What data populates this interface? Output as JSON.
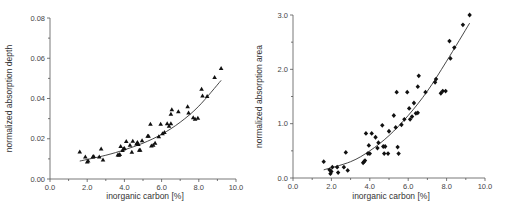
{
  "chart_data": [
    {
      "type": "scatter",
      "title": "",
      "xlabel": "inorganic carbon [%]",
      "ylabel": "normalized absorption depth",
      "xlim": [
        0,
        10
      ],
      "ylim": [
        0,
        0.08
      ],
      "xticks": [
        "0.0",
        "2.0",
        "4.0",
        "6.0",
        "8.0",
        "10.0"
      ],
      "xtick_values": [
        0,
        2,
        4,
        6,
        8,
        10
      ],
      "yticks": [
        "0.00",
        "0.02",
        "0.04",
        "0.06",
        "0.08"
      ],
      "ytick_values": [
        0,
        0.02,
        0.04,
        0.06,
        0.08
      ],
      "marker": "triangle",
      "grid": false,
      "series": [
        {
          "name": "samples",
          "points": [
            [
              1.6,
              0.0135
            ],
            [
              1.9,
              0.011
            ],
            [
              2.0,
              0.0085
            ],
            [
              2.05,
              0.009
            ],
            [
              2.3,
              0.011
            ],
            [
              2.35,
              0.0112
            ],
            [
              2.65,
              0.011
            ],
            [
              2.75,
              0.015
            ],
            [
              2.85,
              0.0095
            ],
            [
              3.65,
              0.012
            ],
            [
              3.7,
              0.0118
            ],
            [
              3.75,
              0.0122
            ],
            [
              3.8,
              0.0162
            ],
            [
              3.9,
              0.0142
            ],
            [
              3.95,
              0.015
            ],
            [
              4.0,
              0.0152
            ],
            [
              4.1,
              0.0187
            ],
            [
              4.3,
              0.0168
            ],
            [
              4.4,
              0.0133
            ],
            [
              4.45,
              0.0188
            ],
            [
              4.65,
              0.0175
            ],
            [
              4.7,
              0.0182
            ],
            [
              4.75,
              0.0172
            ],
            [
              4.8,
              0.0143
            ],
            [
              4.85,
              0.0143
            ],
            [
              4.95,
              0.019
            ],
            [
              5.25,
              0.0213
            ],
            [
              5.3,
              0.0213
            ],
            [
              5.4,
              0.0273
            ],
            [
              5.45,
              0.0165
            ],
            [
              5.55,
              0.0168
            ],
            [
              5.65,
              0.0178
            ],
            [
              5.85,
              0.021
            ],
            [
              5.95,
              0.0273
            ],
            [
              6.05,
              0.0225
            ],
            [
              6.15,
              0.0232
            ],
            [
              6.3,
              0.0275
            ],
            [
              6.4,
              0.0262
            ],
            [
              6.5,
              0.0275
            ],
            [
              6.5,
              0.0322
            ],
            [
              6.55,
              0.0345
            ],
            [
              6.9,
              0.0335
            ],
            [
              7.4,
              0.036
            ],
            [
              7.45,
              0.0328
            ],
            [
              7.7,
              0.0305
            ],
            [
              7.8,
              0.0298
            ],
            [
              7.95,
              0.0302
            ],
            [
              8.15,
              0.0447
            ],
            [
              8.2,
              0.0413
            ],
            [
              8.45,
              0.041
            ],
            [
              8.85,
              0.0505
            ],
            [
              9.2,
              0.055
            ]
          ]
        }
      ],
      "fit": {
        "type": "exponential",
        "x_range": [
          1.6,
          9.2
        ],
        "points": [
          [
            1.6,
            0.0089
          ],
          [
            3.0,
            0.0118
          ],
          [
            4.0,
            0.0145
          ],
          [
            5.0,
            0.0178
          ],
          [
            6.0,
            0.0222
          ],
          [
            7.0,
            0.0282
          ],
          [
            8.0,
            0.0362
          ],
          [
            9.2,
            0.049
          ]
        ]
      }
    },
    {
      "type": "scatter",
      "title": "",
      "xlabel": "inorganic carbon [%]",
      "ylabel": "normalized absorption area",
      "xlim": [
        0,
        10
      ],
      "ylim": [
        0,
        3.0
      ],
      "xticks": [
        "0.0",
        "2.0",
        "4.0",
        "6.0",
        "8.0",
        "10.0"
      ],
      "xtick_values": [
        0,
        2,
        4,
        6,
        8,
        10
      ],
      "yticks": [
        "0.0",
        "1.0",
        "2.0",
        "3.0"
      ],
      "ytick_values": [
        0,
        1,
        2,
        3
      ],
      "marker": "diamond",
      "grid": false,
      "series": [
        {
          "name": "samples",
          "points": [
            [
              1.6,
              0.3
            ],
            [
              1.9,
              0.15
            ],
            [
              1.95,
              0.08
            ],
            [
              2.0,
              0.12
            ],
            [
              2.05,
              0.2
            ],
            [
              2.3,
              0.2
            ],
            [
              2.35,
              0.1
            ],
            [
              2.65,
              0.2
            ],
            [
              2.75,
              0.47
            ],
            [
              2.85,
              0.14
            ],
            [
              3.65,
              0.28
            ],
            [
              3.7,
              0.3
            ],
            [
              3.75,
              0.32
            ],
            [
              3.8,
              0.82
            ],
            [
              3.9,
              0.45
            ],
            [
              3.95,
              0.6
            ],
            [
              4.0,
              0.45
            ],
            [
              4.1,
              0.82
            ],
            [
              4.3,
              0.75
            ],
            [
              4.4,
              0.55
            ],
            [
              4.45,
              0.65
            ],
            [
              4.65,
              0.97
            ],
            [
              4.7,
              0.58
            ],
            [
              4.75,
              0.45
            ],
            [
              4.8,
              0.58
            ],
            [
              4.95,
              0.45
            ],
            [
              5.0,
              0.86
            ],
            [
              5.25,
              1.15
            ],
            [
              5.35,
              0.93
            ],
            [
              5.4,
              1.58
            ],
            [
              5.45,
              0.57
            ],
            [
              5.5,
              0.45
            ],
            [
              5.65,
              0.98
            ],
            [
              5.8,
              1.08
            ],
            [
              5.95,
              1.58
            ],
            [
              6.05,
              1.28
            ],
            [
              6.1,
              1.08
            ],
            [
              6.2,
              1.13
            ],
            [
              6.3,
              1.38
            ],
            [
              6.4,
              1.19
            ],
            [
              6.5,
              1.2
            ],
            [
              6.5,
              1.68
            ],
            [
              6.55,
              1.88
            ],
            [
              6.9,
              1.58
            ],
            [
              7.4,
              1.76
            ],
            [
              7.45,
              1.82
            ],
            [
              7.7,
              1.56
            ],
            [
              7.8,
              1.6
            ],
            [
              7.95,
              1.6
            ],
            [
              8.15,
              2.52
            ],
            [
              8.2,
              2.2
            ],
            [
              8.4,
              2.4
            ],
            [
              8.85,
              2.82
            ],
            [
              9.2,
              3.0
            ]
          ]
        }
      ],
      "fit": {
        "type": "quadratic",
        "x_range": [
          1.6,
          9.2
        ],
        "points": [
          [
            1.6,
            0.15
          ],
          [
            3.0,
            0.3
          ],
          [
            4.0,
            0.5
          ],
          [
            5.0,
            0.78
          ],
          [
            6.0,
            1.15
          ],
          [
            7.0,
            1.6
          ],
          [
            8.0,
            2.15
          ],
          [
            9.2,
            2.85
          ]
        ]
      }
    }
  ]
}
